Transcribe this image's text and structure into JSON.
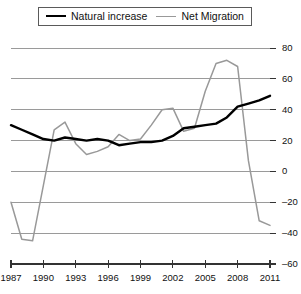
{
  "chart_data": {
    "type": "line",
    "title": "",
    "subtitle": "",
    "xlabel": "",
    "ylabel": "",
    "xlim": [
      1987,
      2011
    ],
    "ylim": [
      -60,
      80
    ],
    "ytick_labels": [
      "80",
      "60",
      "40",
      "20",
      "0",
      "-20",
      "-40",
      "-60"
    ],
    "ytick_values": [
      80,
      60,
      40,
      20,
      0,
      -20,
      -40,
      -60
    ],
    "xtick_labels": [
      "1987",
      "1990",
      "1993",
      "1996",
      "1999",
      "2002",
      "2005",
      "2008",
      "2011"
    ],
    "xtick_values": [
      1987,
      1990,
      1993,
      1996,
      1999,
      2002,
      2005,
      2008,
      2011
    ],
    "grid": true,
    "grid_color": "#9a9a9a",
    "legend_position": "top",
    "x": [
      1987,
      1988,
      1989,
      1990,
      1991,
      1992,
      1993,
      1994,
      1995,
      1996,
      1997,
      1998,
      1999,
      2000,
      2001,
      2002,
      2003,
      2004,
      2005,
      2006,
      2007,
      2008,
      2009,
      2010,
      2011
    ],
    "series": [
      {
        "name": "Natural increase",
        "color": "#000000",
        "width": 2.4,
        "values": [
          30,
          27,
          24,
          21,
          20,
          22,
          21,
          20,
          21,
          20,
          17,
          18,
          19,
          19,
          20,
          23,
          28,
          29,
          30,
          31,
          35,
          42,
          44,
          46,
          49
        ]
      },
      {
        "name": "Net Migration",
        "color": "#999999",
        "width": 1.5,
        "values": [
          -20,
          -44,
          -45,
          -9,
          27,
          32,
          18,
          11,
          13,
          16,
          24,
          20,
          21,
          30,
          40,
          41,
          26,
          28,
          52,
          70,
          72,
          68,
          7,
          -32,
          -35
        ]
      }
    ]
  },
  "legend": {
    "entries": [
      {
        "label": "Natural increase"
      },
      {
        "label": "Net Migration"
      }
    ]
  },
  "colors": {
    "natural_increase": "#000000",
    "net_migration": "#999999",
    "grid": "#9a9a9a",
    "axis": "#333333",
    "background": "#ffffff"
  }
}
